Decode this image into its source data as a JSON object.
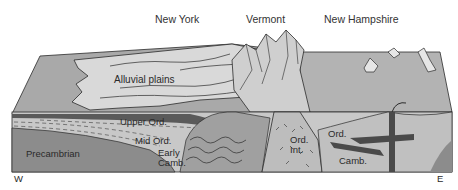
{
  "diagram": {
    "type": "geologic block diagram (cross-section)",
    "region_labels": {
      "new_york": "New York",
      "vermont": "Vermont",
      "new_hampshire": "New Hampshire"
    },
    "surface_labels": {
      "alluvial_plains": "Alluvial plains"
    },
    "strata_labels": {
      "upper_ord": "Upper Ord.",
      "mid_ord": "Mid Ord.",
      "early_camb_1": "Early",
      "early_camb_2": "Camb.",
      "precambrian": "Precambrian",
      "ord_int_1": "Ord.",
      "ord_int_2": "Int.",
      "ord_east": "Ord.",
      "camb_east": "Camb."
    },
    "compass": {
      "west": "W",
      "east": "E"
    },
    "colors": {
      "precambrian": "#8c8c8c",
      "light_strata": "#c8c8c8",
      "dark_layer": "#5a5a5a",
      "surface_light": "#d6d6d6",
      "surface_mid": "#a9a9a9",
      "outline": "#2b2b2b"
    }
  }
}
